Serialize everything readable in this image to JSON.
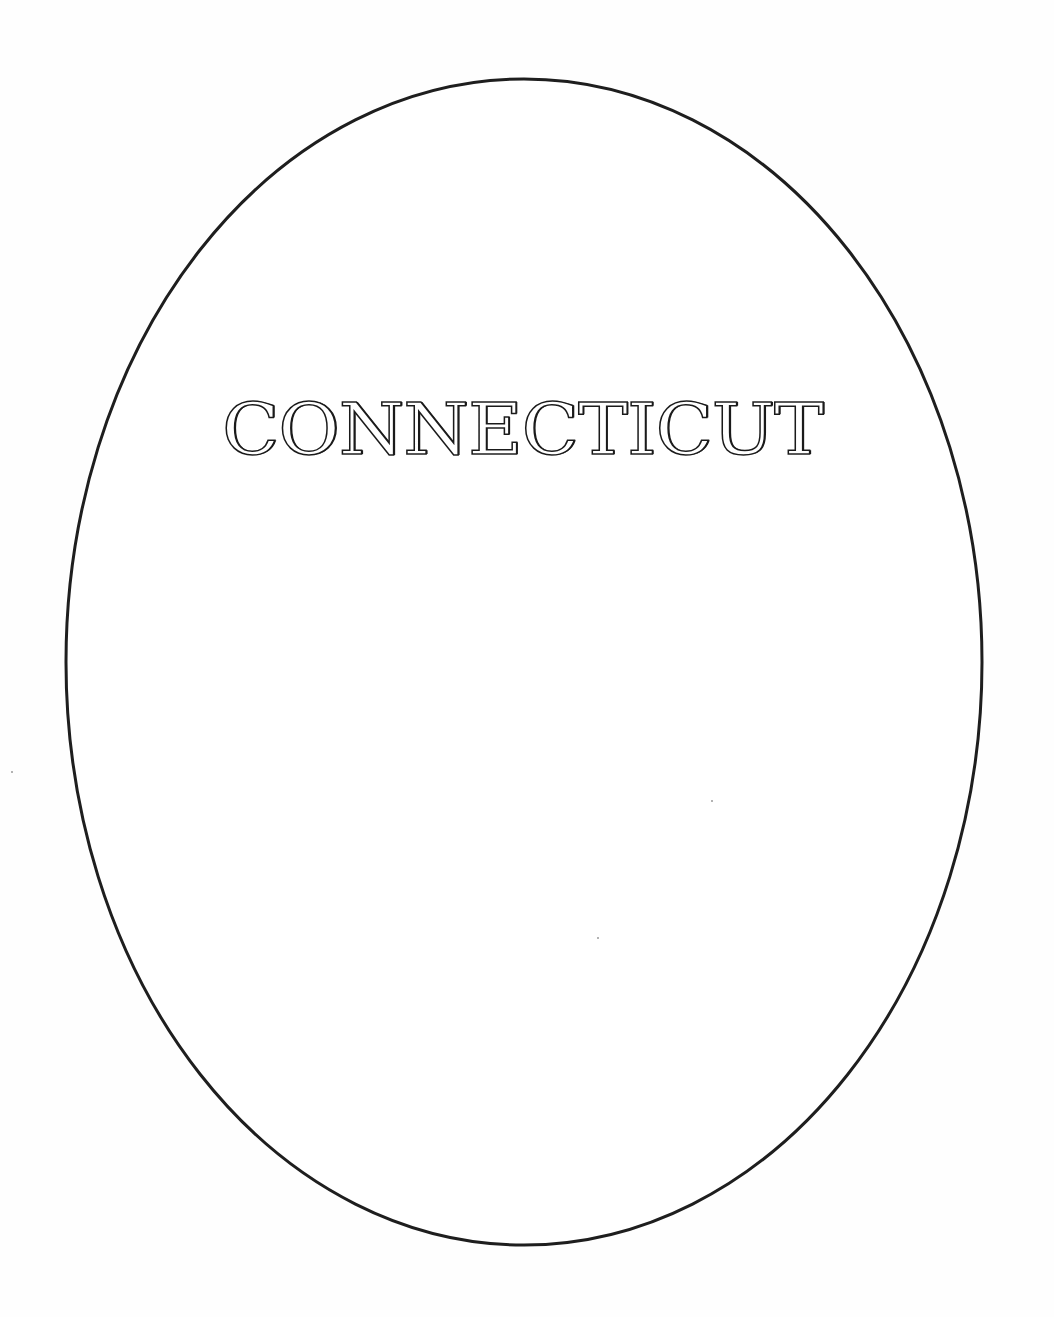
{
  "page": {
    "title": "CONNECTICUT"
  },
  "frame": {
    "shape": "ellipse",
    "stroke_color": "#1e1e1e",
    "fill_color": "#ffffff",
    "cx": 524,
    "cy": 662,
    "rx": 458,
    "ry": 583,
    "stroke_width": 3
  }
}
